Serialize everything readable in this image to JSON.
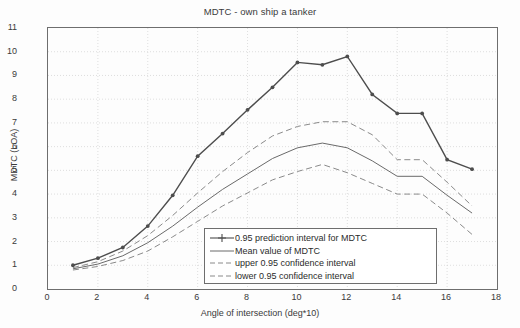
{
  "chart_data": {
    "type": "line",
    "title": "MDTC - own ship a tanker",
    "xlabel": "Angle of intersection (deg*10)",
    "ylabel": "MDTC (LOA)",
    "xlim": [
      0,
      18
    ],
    "ylim": [
      0,
      11
    ],
    "xticks": [
      0,
      2,
      4,
      6,
      8,
      10,
      12,
      14,
      16,
      18
    ],
    "yticks": [
      0,
      1,
      2,
      3,
      4,
      5,
      6,
      7,
      8,
      9,
      10,
      11
    ],
    "grid": true,
    "legend_position": "lower center-right",
    "x": [
      1,
      2,
      3,
      4,
      5,
      6,
      7,
      8,
      9,
      10,
      11,
      12,
      13,
      14,
      15,
      16,
      17
    ],
    "series": [
      {
        "name": "0.95 prediction interval for MDTC",
        "style": "solid-with-markers",
        "color": "#4d4d4d",
        "values": [
          1.0,
          1.3,
          1.75,
          2.65,
          3.95,
          5.6,
          6.55,
          7.55,
          8.5,
          9.55,
          9.45,
          9.8,
          8.2,
          7.4,
          7.4,
          5.45,
          5.05
        ]
      },
      {
        "name": "Mean value of MDTC",
        "style": "solid",
        "color": "#6a6a6a",
        "values": [
          0.85,
          1.05,
          1.4,
          1.95,
          2.65,
          3.45,
          4.2,
          4.85,
          5.5,
          5.95,
          6.15,
          5.95,
          5.4,
          4.75,
          4.75,
          3.95,
          3.2
        ]
      },
      {
        "name": "upper 0.95 confidence interval",
        "style": "dashed",
        "color": "#8a8a8a",
        "values": [
          0.9,
          1.15,
          1.6,
          2.25,
          3.1,
          4.05,
          4.95,
          5.75,
          6.45,
          6.85,
          7.05,
          7.05,
          6.5,
          5.45,
          5.45,
          4.5,
          3.5
        ]
      },
      {
        "name": "lower 0.95 confidence interval",
        "style": "dashed",
        "color": "#8a8a8a",
        "values": [
          0.8,
          0.95,
          1.2,
          1.6,
          2.2,
          2.85,
          3.5,
          4.05,
          4.6,
          4.95,
          5.25,
          4.9,
          4.45,
          4.0,
          4.0,
          3.2,
          2.3
        ]
      }
    ]
  },
  "legend": {
    "items": [
      {
        "label": "0.95 prediction interval for MDTC",
        "symbol": "solid-line-with-marker"
      },
      {
        "label": "Mean value of MDTC",
        "symbol": "solid-line"
      },
      {
        "label": "upper 0.95 confidence interval",
        "symbol": "dashed-line"
      },
      {
        "label": "lower 0.95 confidence interval",
        "symbol": "dashed-line"
      }
    ]
  }
}
